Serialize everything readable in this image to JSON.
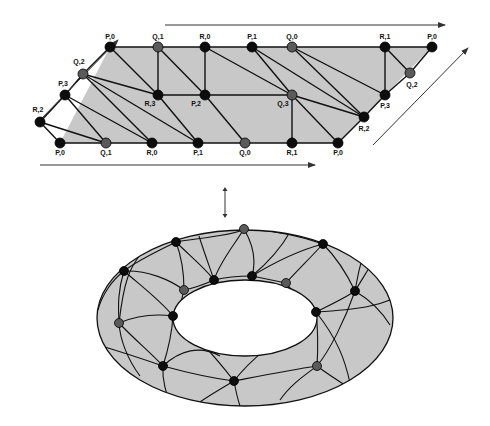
{
  "colors": {
    "background": "#ffffff",
    "face_fill": "#c8c8c8",
    "edge": "#111111",
    "vertex_dark": "#0d0d0d",
    "vertex_gray": "#5a5a5a",
    "arrow": "#333333"
  },
  "planar": {
    "vertices": [
      {
        "id": "t0",
        "label": "P,0",
        "x": 110,
        "y": 47,
        "shade": "dark",
        "lx": 110,
        "ly": 39
      },
      {
        "id": "t1",
        "label": "Q,1",
        "x": 158,
        "y": 47,
        "shade": "gray",
        "lx": 158,
        "ly": 39
      },
      {
        "id": "t2",
        "label": "R,0",
        "x": 205,
        "y": 47,
        "shade": "dark",
        "lx": 205,
        "ly": 39
      },
      {
        "id": "t3",
        "label": "P,1",
        "x": 252,
        "y": 47,
        "shade": "dark",
        "lx": 252,
        "ly": 39
      },
      {
        "id": "t4",
        "label": "Q,0",
        "x": 292,
        "y": 47,
        "shade": "gray",
        "lx": 292,
        "ly": 39
      },
      {
        "id": "t5",
        "label": "R,1",
        "x": 385,
        "y": 47,
        "shade": "dark",
        "lx": 385,
        "ly": 39
      },
      {
        "id": "t6",
        "label": "P,0",
        "x": 432,
        "y": 47,
        "shade": "dark",
        "lx": 432,
        "ly": 39
      },
      {
        "id": "q2l",
        "label": "Q,2",
        "x": 83,
        "y": 74,
        "shade": "gray",
        "lx": 79,
        "ly": 64
      },
      {
        "id": "p3l",
        "label": "P,3",
        "x": 65,
        "y": 95,
        "shade": "dark",
        "lx": 63,
        "ly": 86
      },
      {
        "id": "r2l",
        "label": "R,2",
        "x": 40,
        "y": 122,
        "shade": "dark",
        "lx": 38,
        "ly": 112
      },
      {
        "id": "m1",
        "label": "R,3",
        "x": 158,
        "y": 95,
        "shade": "dark",
        "lx": 150,
        "ly": 106
      },
      {
        "id": "m2",
        "label": "P,2",
        "x": 205,
        "y": 95,
        "shade": "dark",
        "lx": 196,
        "ly": 106
      },
      {
        "id": "m3",
        "label": "Q,3",
        "x": 292,
        "y": 95,
        "shade": "gray",
        "lx": 283,
        "ly": 106
      },
      {
        "id": "p3r",
        "label": "P,3",
        "x": 385,
        "y": 95,
        "shade": "dark",
        "lx": 385,
        "ly": 108
      },
      {
        "id": "q2r",
        "label": "Q,2",
        "x": 410,
        "y": 73,
        "shade": "gray",
        "lx": 412,
        "ly": 87
      },
      {
        "id": "r2r",
        "label": "R,2",
        "x": 364,
        "y": 117,
        "shade": "dark",
        "lx": 364,
        "ly": 131
      },
      {
        "id": "b0",
        "label": "P,0",
        "x": 60,
        "y": 143,
        "shade": "dark",
        "lx": 60,
        "ly": 155
      },
      {
        "id": "b1",
        "label": "Q,1",
        "x": 106,
        "y": 143,
        "shade": "gray",
        "lx": 106,
        "ly": 155
      },
      {
        "id": "b2",
        "label": "R,0",
        "x": 152,
        "y": 143,
        "shade": "dark",
        "lx": 152,
        "ly": 155
      },
      {
        "id": "b3",
        "label": "P,1",
        "x": 198,
        "y": 143,
        "shade": "dark",
        "lx": 198,
        "ly": 155
      },
      {
        "id": "b4",
        "label": "Q,0",
        "x": 245,
        "y": 143,
        "shade": "gray",
        "lx": 245,
        "ly": 155
      },
      {
        "id": "b5",
        "label": "R,1",
        "x": 292,
        "y": 143,
        "shade": "dark",
        "lx": 292,
        "ly": 155
      },
      {
        "id": "b6",
        "label": "P,0",
        "x": 338,
        "y": 143,
        "shade": "dark",
        "lx": 338,
        "ly": 155
      }
    ],
    "edges": [
      [
        "t0",
        "t6"
      ],
      [
        "b0",
        "b6"
      ],
      [
        "b0",
        "r2l"
      ],
      [
        "r2l",
        "p3l"
      ],
      [
        "p3l",
        "q2l"
      ],
      [
        "q2l",
        "t0"
      ],
      [
        "b6",
        "r2r"
      ],
      [
        "r2r",
        "p3r"
      ],
      [
        "p3r",
        "q2r"
      ],
      [
        "q2r",
        "t6"
      ],
      [
        "r2l",
        "b1"
      ],
      [
        "p3l",
        "b1"
      ],
      [
        "p3l",
        "b2"
      ],
      [
        "q2l",
        "b2"
      ],
      [
        "q2l",
        "b3"
      ],
      [
        "q2l",
        "m1"
      ],
      [
        "t0",
        "m1"
      ],
      [
        "m1",
        "b3"
      ],
      [
        "t1",
        "m1"
      ],
      [
        "m1",
        "m2"
      ],
      [
        "t1",
        "m2"
      ],
      [
        "m2",
        "b4"
      ],
      [
        "t2",
        "m2"
      ],
      [
        "t2",
        "m3"
      ],
      [
        "m2",
        "m3"
      ],
      [
        "m3",
        "b5"
      ],
      [
        "t3",
        "m3"
      ],
      [
        "m3",
        "b6"
      ],
      [
        "m3",
        "r2r"
      ],
      [
        "t3",
        "r2r"
      ],
      [
        "t4",
        "r2r"
      ],
      [
        "t4",
        "p3r"
      ],
      [
        "t5",
        "p3r"
      ],
      [
        "t5",
        "q2r"
      ]
    ]
  },
  "arrows": {
    "top": {
      "x1": 165,
      "y1": 25,
      "x2": 445,
      "y2": 25
    },
    "bottom": {
      "x1": 40,
      "y1": 165,
      "x2": 315,
      "y2": 165
    },
    "left": {
      "x1": 40,
      "y1": 120,
      "x2": 118,
      "y2": 40
    },
    "right": {
      "x1": 373,
      "y1": 145,
      "x2": 468,
      "y2": 48
    },
    "connector": {
      "x": 225,
      "y1": 187,
      "y2": 218
    }
  },
  "torus": {
    "outer": {
      "cx": 245,
      "cy": 318,
      "rx": 148,
      "ry": 88
    },
    "inner": {
      "cx": 245,
      "cy": 318,
      "rx": 72,
      "ry": 38
    },
    "vertices": [
      {
        "x": 244,
        "y": 229,
        "shade": "gray"
      },
      {
        "x": 176,
        "y": 242,
        "shade": "dark"
      },
      {
        "x": 323,
        "y": 244,
        "shade": "dark"
      },
      {
        "x": 124,
        "y": 271,
        "shade": "dark"
      },
      {
        "x": 214,
        "y": 280,
        "shade": "dark"
      },
      {
        "x": 252,
        "y": 276,
        "shade": "dark"
      },
      {
        "x": 286,
        "y": 283,
        "shade": "gray"
      },
      {
        "x": 184,
        "y": 290,
        "shade": "gray"
      },
      {
        "x": 355,
        "y": 291,
        "shade": "dark"
      },
      {
        "x": 173,
        "y": 316,
        "shade": "dark"
      },
      {
        "x": 316,
        "y": 312,
        "shade": "dark"
      },
      {
        "x": 119,
        "y": 323,
        "shade": "gray"
      },
      {
        "x": 163,
        "y": 366,
        "shade": "dark"
      },
      {
        "x": 317,
        "y": 366,
        "shade": "gray"
      },
      {
        "x": 234,
        "y": 381,
        "shade": "dark"
      }
    ]
  }
}
